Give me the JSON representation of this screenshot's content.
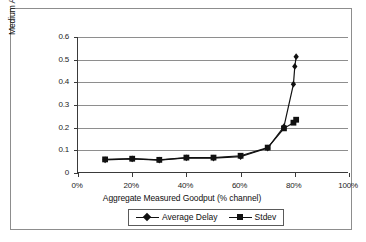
{
  "chart_data": {
    "type": "line",
    "title": "",
    "xlabel": "Aggregate Measured Goodput (% channel)",
    "ylabel": "Medium Access Delay (s)",
    "xlim": [
      0,
      100
    ],
    "ylim": [
      0,
      0.6
    ],
    "xticks": [
      0,
      20,
      40,
      60,
      80,
      100
    ],
    "xtick_labels": [
      "0%",
      "20%",
      "40%",
      "60%",
      "80%",
      "100%"
    ],
    "yticks": [
      0,
      0.1,
      0.2,
      0.3,
      0.4,
      0.5,
      0.6
    ],
    "ytick_labels": [
      "0",
      "0.1",
      "0.2",
      "0.3",
      "0.4",
      "0.5",
      "0.6"
    ],
    "grid": "horizontal",
    "legend_position": "bottom",
    "series": [
      {
        "name": "Average Delay",
        "marker": "diamond",
        "color": "#111111",
        "x": [
          10,
          20,
          30,
          40,
          50,
          60,
          70,
          76,
          79.5,
          80,
          80.5
        ],
        "y": [
          0.058,
          0.062,
          0.057,
          0.067,
          0.066,
          0.072,
          0.11,
          0.205,
          0.392,
          0.47,
          0.513
        ]
      },
      {
        "name": "Stdev",
        "marker": "square",
        "color": "#111111",
        "x": [
          10,
          20,
          30,
          40,
          50,
          60,
          70,
          76,
          79.5,
          80.5
        ],
        "y": [
          0.06,
          0.063,
          0.058,
          0.068,
          0.068,
          0.076,
          0.112,
          0.197,
          0.222,
          0.235
        ]
      }
    ]
  },
  "legend": {
    "items": [
      {
        "label": "Average Delay",
        "marker": "diamond"
      },
      {
        "label": "Stdev",
        "marker": "square"
      }
    ]
  }
}
